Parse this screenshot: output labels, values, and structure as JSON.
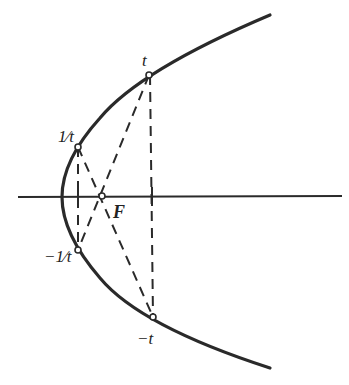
{
  "diagram": {
    "type": "parabola-focal-chords",
    "colors": {
      "stroke": "#2a2a2a",
      "background": "#ffffff"
    },
    "labels": {
      "t": "t",
      "inv_t": "1⁄t",
      "neg_inv_t": "−1⁄t",
      "neg_t": "−t",
      "focus": "F"
    },
    "points": [
      {
        "name": "t",
        "x": 149,
        "y": 75
      },
      {
        "name": "1/t",
        "x": 78,
        "y": 147
      },
      {
        "name": "-1/t",
        "x": 78,
        "y": 250
      },
      {
        "name": "-t",
        "x": 153,
        "y": 317
      },
      {
        "name": "F",
        "x": 102,
        "y": 196
      }
    ]
  }
}
